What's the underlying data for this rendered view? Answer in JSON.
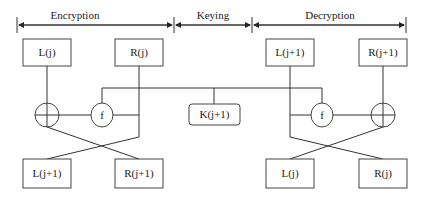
{
  "sections": {
    "encryption": "Encryption",
    "keying": "Keying",
    "decryption": "Decryption"
  },
  "encryption": {
    "inputs": {
      "left": "L(j)",
      "right": "R(j)"
    },
    "xor_symbol": "⊕",
    "function_label": "f",
    "outputs": {
      "left": "L(j+1)",
      "right": "R(j+1)"
    }
  },
  "keying": {
    "key_label": "K(j+1)"
  },
  "decryption": {
    "inputs": {
      "left": "L(j+1)",
      "right": "R(j+1)"
    },
    "xor_symbol": "⊕",
    "function_label": "f",
    "outputs": {
      "left": "L(j)",
      "right": "R(j)"
    }
  },
  "colors": {
    "line": "#333333",
    "background": "#ffffff",
    "text": "#222222"
  }
}
